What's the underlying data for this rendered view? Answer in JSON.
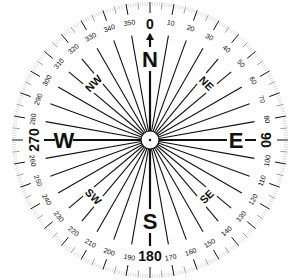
{
  "compass": {
    "center": [
      150,
      140
    ],
    "outer_radius": 138,
    "hub_radius": 9,
    "colors": {
      "ink": "#111111",
      "ring": "#cccccc",
      "background": "#ffffff"
    },
    "cardinals": [
      {
        "label": "N",
        "angle": 0
      },
      {
        "label": "E",
        "angle": 90
      },
      {
        "label": "S",
        "angle": 180
      },
      {
        "label": "W",
        "angle": 270
      }
    ],
    "intercardinals": [
      {
        "label": "NE",
        "angle": 45
      },
      {
        "label": "SE",
        "angle": 135
      },
      {
        "label": "SW",
        "angle": 225
      },
      {
        "label": "NW",
        "angle": 315
      }
    ],
    "degree_labels": [
      "0",
      "10",
      "20",
      "30",
      "40",
      "50",
      "60",
      "70",
      "80",
      "90",
      "100",
      "110",
      "120",
      "130",
      "140",
      "150",
      "160",
      "170",
      "180",
      "190",
      "200",
      "210",
      "220",
      "230",
      "240",
      "250",
      "260",
      "270",
      "280",
      "290",
      "300",
      "310",
      "320",
      "330",
      "340",
      "350"
    ],
    "major_degree_labels": [
      "0",
      "90",
      "180",
      "270"
    ],
    "north_arrow": "arrow-up"
  }
}
